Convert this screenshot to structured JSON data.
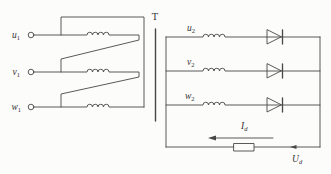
{
  "diagram": {
    "transformer_label": "T",
    "primary_inputs": [
      {
        "base": "u",
        "sub": "1"
      },
      {
        "base": "v",
        "sub": "1"
      },
      {
        "base": "w",
        "sub": "1"
      }
    ],
    "secondary_phases": [
      {
        "base": "u",
        "sub": "2"
      },
      {
        "base": "v",
        "sub": "2"
      },
      {
        "base": "w",
        "sub": "2"
      }
    ],
    "dc_current_label": {
      "base": "I",
      "sub": "d"
    },
    "dc_voltage_label": {
      "base": "U",
      "sub": "d"
    },
    "colors": {
      "line": "#474747",
      "text": "#333333",
      "background": "#fcfcfb"
    }
  }
}
